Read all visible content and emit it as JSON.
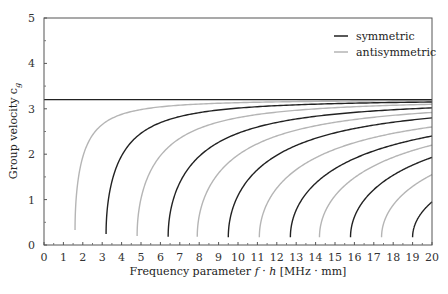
{
  "chart_data": {
    "type": "line",
    "title": "",
    "xlabel": "Frequency parameter f · h [MHz · mm]",
    "xlabel_parts": {
      "prefix": "Frequency parameter ",
      "f": "f",
      "dot": " · ",
      "h": "h",
      "suffix": " [MHz · mm]"
    },
    "ylabel": "Group velocity c_g",
    "ylabel_parts": {
      "main": "Group velocity c",
      "sub": "g"
    },
    "xlim": [
      0,
      20
    ],
    "ylim": [
      0,
      5
    ],
    "xticks": [
      0,
      1,
      2,
      3,
      4,
      5,
      6,
      7,
      8,
      9,
      10,
      11,
      12,
      13,
      14,
      15,
      16,
      17,
      18,
      19,
      20
    ],
    "yticks": [
      0,
      1,
      2,
      3,
      4,
      5
    ],
    "grid": false,
    "legend_position": "upper right",
    "asymptote": {
      "y": 3.2,
      "color": "#222222"
    },
    "colors": {
      "symmetric": "#222222",
      "antisymmetric": "#b5b5b5"
    },
    "legend": [
      {
        "label": "symmetric",
        "color": "#222222"
      },
      {
        "label": "antisymmetric",
        "color": "#b5b5b5"
      }
    ],
    "series": [
      {
        "name": "antisymmetric",
        "mode": 1,
        "cutoff": 1.6,
        "start_value": 0.33,
        "value_at_20": 3.18
      },
      {
        "name": "symmetric",
        "mode": 1,
        "cutoff": 3.2,
        "start_value": 0.24,
        "value_at_20": 3.15
      },
      {
        "name": "antisymmetric",
        "mode": 2,
        "cutoff": 4.8,
        "start_value": 0.2,
        "value_at_20": 3.1
      },
      {
        "name": "symmetric",
        "mode": 2,
        "cutoff": 6.4,
        "start_value": 0.18,
        "value_at_20": 3.02
      },
      {
        "name": "antisymmetric",
        "mode": 3,
        "cutoff": 7.9,
        "start_value": 0.18,
        "value_at_20": 2.92
      },
      {
        "name": "symmetric",
        "mode": 3,
        "cutoff": 9.5,
        "start_value": 0.17,
        "value_at_20": 2.8
      },
      {
        "name": "antisymmetric",
        "mode": 4,
        "cutoff": 11.1,
        "start_value": 0.17,
        "value_at_20": 2.6
      },
      {
        "name": "symmetric",
        "mode": 4,
        "cutoff": 12.7,
        "start_value": 0.17,
        "value_at_20": 2.4
      },
      {
        "name": "antisymmetric",
        "mode": 5,
        "cutoff": 14.2,
        "start_value": 0.17,
        "value_at_20": 2.2
      },
      {
        "name": "symmetric",
        "mode": 5,
        "cutoff": 15.8,
        "start_value": 0.17,
        "value_at_20": 1.93
      },
      {
        "name": "antisymmetric",
        "mode": 6,
        "cutoff": 17.4,
        "start_value": 0.17,
        "value_at_20": 1.55
      },
      {
        "name": "symmetric",
        "mode": 6,
        "cutoff": 19.0,
        "start_value": 0.17,
        "value_at_20": 0.95
      }
    ]
  }
}
